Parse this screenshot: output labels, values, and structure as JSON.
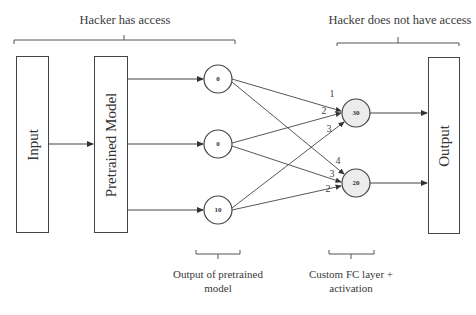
{
  "header": {
    "left_label": "Hacker has access",
    "right_label": "Hacker does not have access"
  },
  "blocks": {
    "input": "Input",
    "pretrained": "Pretrained Model",
    "output": "Output"
  },
  "hidden_nodes": [
    {
      "value": "0"
    },
    {
      "value": "0"
    },
    {
      "value": "10"
    }
  ],
  "output_nodes": [
    {
      "value": "30"
    },
    {
      "value": "20"
    }
  ],
  "weights": {
    "to_out1": [
      "1",
      "2",
      "3"
    ],
    "to_out2": [
      "4",
      "3",
      "2"
    ]
  },
  "captions": {
    "pretrained_output": "Output of pretrained model",
    "custom_layer": "Custom FC layer + activation"
  },
  "colors": {
    "line": "#444444",
    "node_fill_hidden": "#ffffff",
    "node_fill_output": "#ececec"
  }
}
